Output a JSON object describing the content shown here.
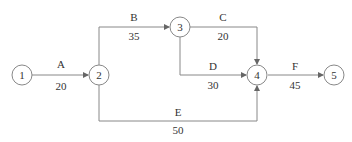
{
  "diagram": {
    "type": "activity-on-arrow network",
    "nodes": [
      {
        "id": "1",
        "label": "1",
        "x": 22,
        "y": 75
      },
      {
        "id": "2",
        "label": "2",
        "x": 99,
        "y": 75
      },
      {
        "id": "3",
        "label": "3",
        "x": 180,
        "y": 27
      },
      {
        "id": "4",
        "label": "4",
        "x": 257,
        "y": 75
      },
      {
        "id": "5",
        "label": "5",
        "x": 334,
        "y": 75
      }
    ],
    "activities": [
      {
        "name": "A",
        "duration": "20",
        "from": "1",
        "to": "2",
        "name_pos": [
          61,
          64
        ],
        "dur_pos": [
          61,
          86
        ]
      },
      {
        "name": "B",
        "duration": "35",
        "from": "2",
        "to": "3",
        "name_pos": [
          134,
          17
        ],
        "dur_pos": [
          134,
          36
        ]
      },
      {
        "name": "C",
        "duration": "20",
        "from": "3",
        "to": "4",
        "name_pos": [
          223,
          17
        ],
        "dur_pos": [
          223,
          36
        ]
      },
      {
        "name": "D",
        "duration": "30",
        "from": "3",
        "to": "4",
        "name_pos": [
          213,
          66
        ],
        "dur_pos": [
          213,
          85
        ]
      },
      {
        "name": "E",
        "duration": "50",
        "from": "2",
        "to": "4",
        "name_pos": [
          178,
          112
        ],
        "dur_pos": [
          178,
          130
        ]
      },
      {
        "name": "F",
        "duration": "45",
        "from": "4",
        "to": "5",
        "name_pos": [
          295,
          66
        ],
        "dur_pos": [
          295,
          85
        ]
      }
    ],
    "colors": {
      "line": "#888888",
      "text": "#333333",
      "node_fill": "#ffffff"
    }
  }
}
